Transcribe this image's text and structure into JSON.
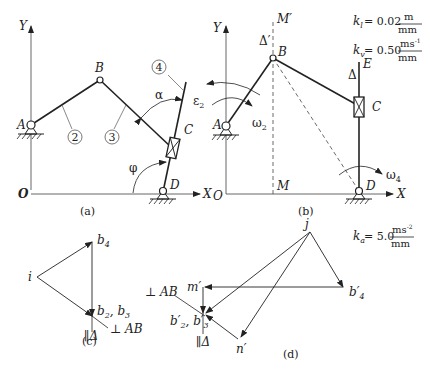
{
  "figures": {
    "a": {
      "caption": "(a)",
      "axes": {
        "y": "Y",
        "x": "X",
        "origin": "O"
      },
      "points": {
        "A": "A",
        "B": "B",
        "C": "C",
        "D": "D"
      },
      "links": [
        "2",
        "3",
        "4"
      ],
      "angles": {
        "alpha": "α",
        "phi": "φ",
        "eps": "ε",
        "eps_sub": "2"
      }
    },
    "b": {
      "caption": "(b)",
      "axes": {
        "y": "Y",
        "x": "X",
        "origin": "O",
        "x_left": "X"
      },
      "points": {
        "A": "A",
        "B": "B",
        "C": "C",
        "D": "D",
        "E": "E",
        "M": "M",
        "Mp": "M′"
      },
      "delta": "Δ",
      "delta_prime": "Δ′",
      "omega2": "ω",
      "omega2_sub": "2",
      "omega4": "ω",
      "omega4_sub": "4"
    },
    "c": {
      "caption": "(c)",
      "labels": {
        "i": "i",
        "b4": "b",
        "b4_sub": "4",
        "b23": "b",
        "b23_sub2": "2",
        "b23_sep": ", b",
        "b23_sub3": "3",
        "perp_ab": "⊥ AB",
        "par_delta": "∥Δ"
      }
    },
    "d": {
      "caption": "(d)",
      "labels": {
        "j": "j",
        "mp": "m′",
        "np": "n′",
        "b4p": "b′",
        "b4p_sub": "4",
        "b23p": "b′",
        "b23p_sub2": "2",
        "b23p_sep": ", b′",
        "b23p_sub3": "3",
        "perp_ab": "⊥ AB",
        "par_delta": "∥Δ"
      }
    }
  },
  "scales": {
    "kl": {
      "sym": "k",
      "sub": "l",
      "value": "= 0.02",
      "num": "m",
      "den": "mm"
    },
    "kv": {
      "sym": "k",
      "sub": "v",
      "value": "= 0.50",
      "num": "ms",
      "num_sup": "-1",
      "den": "mm"
    },
    "ka": {
      "sym": "k",
      "sub": "a",
      "value": "= 5.0",
      "num": "ms",
      "num_sup": "-2",
      "den": "mm"
    }
  }
}
